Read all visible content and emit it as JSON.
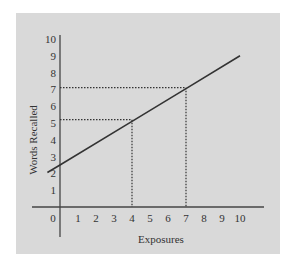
{
  "chart_data": {
    "type": "line",
    "title": "",
    "xlabel": "Exposures",
    "ylabel": "Words Recalled",
    "x_ticks": [
      "0",
      "1",
      "2",
      "3",
      "4",
      "5",
      "6",
      "7",
      "8",
      "9",
      "10"
    ],
    "y_ticks": [
      "1",
      "2",
      "3",
      "4",
      "5",
      "6",
      "7",
      "8",
      "9",
      "10"
    ],
    "xlim": [
      0,
      10
    ],
    "ylim": [
      0,
      10
    ],
    "grid": false,
    "legend": null,
    "series": [
      {
        "name": "Words Recalled vs Exposures",
        "x": [
          -0.7,
          0,
          4,
          7,
          10
        ],
        "y": [
          2.05,
          2.5,
          5.1,
          7.05,
          9.0
        ],
        "style": "solid"
      }
    ],
    "annotations": [
      {
        "type": "dotted-guide",
        "x": 4,
        "y": 5.2,
        "description": "Dotted lines from x=4 up to the line and across to y≈5.2"
      },
      {
        "type": "dotted-guide",
        "x": 7,
        "y": 7.1,
        "description": "Dotted lines from x=7 up to the line and across to y≈7.1"
      }
    ],
    "colors": {
      "background": "#d9d9d9",
      "line": "#333333",
      "axes": "#444444"
    }
  }
}
